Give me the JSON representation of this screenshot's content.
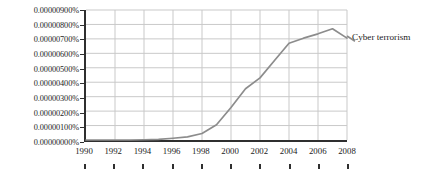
{
  "chart_data": {
    "type": "line",
    "title": "",
    "xlabel": "",
    "ylabel": "",
    "xlim": [
      1990,
      2008
    ],
    "ylim": [
      0,
      9e-06
    ],
    "grid": true,
    "legend_position": "right-of-plot",
    "x_tick_labels": [
      "1990",
      "1992",
      "1994",
      "1996",
      "1998",
      "2000",
      "2002",
      "2004",
      "2006",
      "2008"
    ],
    "x_ticks": [
      1990,
      1992,
      1994,
      1996,
      1998,
      2000,
      2002,
      2004,
      2006,
      2008
    ],
    "y_tick_labels": [
      "0.00000900%",
      "0.00000800%",
      "0.00000700%",
      "0.00000600%",
      "0.00000500%",
      "0.00000400%",
      "0.00000300%",
      "0.00000200%",
      "0.00000100%",
      "0.00000000%"
    ],
    "y_ticks": [
      9e-06,
      8e-06,
      7e-06,
      6e-06,
      5e-06,
      4e-06,
      3e-06,
      2e-06,
      1e-06,
      0
    ],
    "x": [
      1990,
      1991,
      1992,
      1993,
      1994,
      1995,
      1996,
      1997,
      1998,
      1999,
      2000,
      2001,
      2002,
      2003,
      2004,
      2005,
      2006,
      2007,
      2008
    ],
    "series": [
      {
        "name": "Cyber terrorism",
        "color": "#8c8c8c",
        "values": [
          0.0,
          0.0,
          0.0,
          0.0,
          2e-08,
          4e-08,
          1.2e-07,
          2.2e-07,
          4.5e-07,
          1.05e-06,
          2.25e-06,
          3.55e-06,
          4.3e-06,
          5.5e-06,
          6.7e-06,
          7.05e-06,
          7.35e-06,
          7.7e-06,
          7.05e-06
        ]
      }
    ],
    "legend": [
      {
        "label": "Cyber terrorism",
        "color": "#8c8c8c"
      }
    ]
  },
  "colors": {
    "axis": "#2f2f2f",
    "grid": "#c8c8c8",
    "series": "#8c8c8c",
    "text": "#1c1c1c",
    "background": "#ffffff"
  }
}
